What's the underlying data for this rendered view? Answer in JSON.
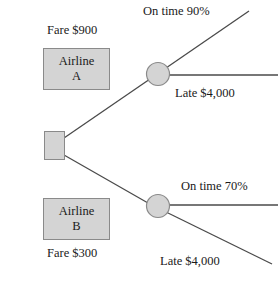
{
  "diagram": {
    "type": "decision-tree",
    "title": "",
    "canvas": {
      "width": 278,
      "height": 283
    },
    "colors": {
      "node_fill": "#d4d4d4",
      "node_stroke": "#8a8a8a",
      "branch_line": "#4a4a4a",
      "text": "#1a1a1a",
      "background": "#ffffff"
    },
    "root": {
      "shape": "square",
      "label": "",
      "name": "decision-node"
    },
    "alternatives": [
      {
        "id": "airline-a",
        "box_line1": "Airline",
        "box_line2": "A",
        "cost_label": "Fare $900",
        "chance_node": {
          "shape": "circle",
          "name": "chance-node-a"
        },
        "outcomes": [
          {
            "label": "On time 90%",
            "probability": "90%",
            "kind": "on-time"
          },
          {
            "label": "Late $4,000",
            "value": "$4,000",
            "kind": "late"
          }
        ]
      },
      {
        "id": "airline-b",
        "box_line1": "Airline",
        "box_line2": "B",
        "cost_label": "Fare $300",
        "chance_node": {
          "shape": "circle",
          "name": "chance-node-b"
        },
        "outcomes": [
          {
            "label": "On time 70%",
            "probability": "70%",
            "kind": "on-time"
          },
          {
            "label": "Late $4,000",
            "value": "$4,000",
            "kind": "late"
          }
        ]
      }
    ]
  }
}
